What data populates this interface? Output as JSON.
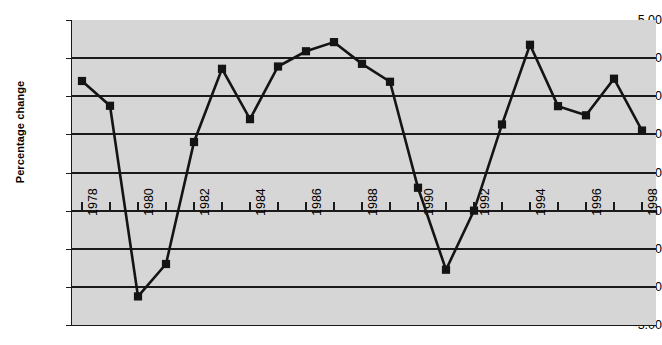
{
  "chart_data": {
    "type": "line",
    "title": "",
    "xlabel": "",
    "ylabel": "Percentage change",
    "ylim": [
      -3.0,
      5.0
    ],
    "xlim": [
      1978,
      1998
    ],
    "y_tick_labels": [
      "5.00",
      "4.00",
      "3.00",
      "2.00",
      "1.00",
      "0.00",
      "-1.00",
      "-2.00",
      "-3.00"
    ],
    "y_tick_values": [
      5.0,
      4.0,
      3.0,
      2.0,
      1.0,
      0.0,
      -1.0,
      -2.0,
      -3.0
    ],
    "grid": "horizontal",
    "legend": "none",
    "x_tick_values": [
      1978,
      1979,
      1980,
      1981,
      1982,
      1983,
      1984,
      1985,
      1986,
      1987,
      1988,
      1989,
      1990,
      1991,
      1992,
      1993,
      1994,
      1995,
      1996,
      1997,
      1998
    ],
    "x_tick_labels": [
      "1978",
      "",
      "1980",
      "",
      "1982",
      "",
      "1984",
      "",
      "1986",
      "",
      "1988",
      "",
      "1990",
      "",
      "1992",
      "",
      "1994",
      "",
      "1996",
      "",
      "1998"
    ],
    "x_label_rotation": -90,
    "x": [
      1978,
      1979,
      1980,
      1981,
      1982,
      1983,
      1984,
      1985,
      1986,
      1987,
      1988,
      1989,
      1990,
      1991,
      1992,
      1993,
      1994,
      1995,
      1996,
      1997,
      1998
    ],
    "values": [
      3.4,
      2.75,
      -2.25,
      -1.4,
      1.8,
      3.72,
      2.4,
      3.78,
      4.18,
      4.42,
      3.85,
      3.38,
      0.6,
      -1.55,
      0.0,
      2.26,
      4.35,
      2.74,
      2.5,
      3.46,
      2.1
    ],
    "marker": "square",
    "marker_color": "#141414",
    "line_color": "#141414",
    "plot_background": "#d6d6d6",
    "figure_background": "#ffffff"
  }
}
